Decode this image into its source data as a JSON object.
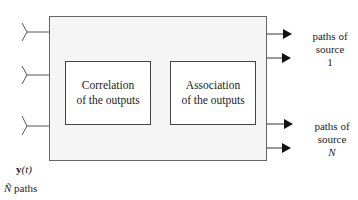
{
  "diagram": {
    "inputs": {
      "count_shown": 3,
      "signal_label": "y(t)",
      "signal_symbol": "y",
      "signal_arg": "(t)",
      "paths_symbol": "Ñ",
      "paths_label": "paths"
    },
    "blocks": [
      {
        "id": "correlation",
        "line1": "Correlation",
        "line2": "of the outputs"
      },
      {
        "id": "association",
        "line1": "Association",
        "line2": "of the outputs"
      }
    ],
    "outputs": [
      {
        "line1": "paths of",
        "line2": "source",
        "line3": "1"
      },
      {
        "line1": "paths of",
        "line2": "source",
        "line3": "N"
      }
    ],
    "colors": {
      "outer_fill": "#f5f5f5",
      "stroke": "#444444",
      "arrow": "#111111"
    }
  }
}
